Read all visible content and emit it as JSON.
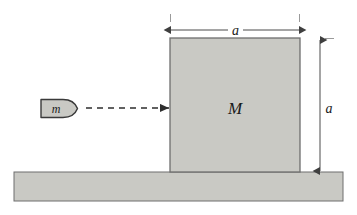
{
  "figure": {
    "background_color": "#ffffff"
  },
  "colors": {
    "block_fill": "#c9c9c4",
    "block_stroke": "#6e6e6e",
    "ground_fill": "#c9c9c4",
    "ground_stroke": "#6e6e6e",
    "bullet_fill": "#c9c9c4",
    "bullet_stroke": "#3a3a3a",
    "dimension_line": "#4a4a4a",
    "velocity_arrow": "#3a3a3a",
    "tick_mark": "#9a9a9a",
    "text": "#1a1a1a"
  },
  "objects": {
    "block": {
      "label": "M",
      "x": 170,
      "y": 38,
      "width": 130,
      "height": 134
    },
    "bullet": {
      "label": "m",
      "x": 40,
      "y": 99,
      "width": 38,
      "height": 19
    },
    "ground": {
      "x": 14,
      "y": 172,
      "width": 329,
      "height": 29
    }
  },
  "velocity_arrow": {
    "name": "dashed-velocity-arrow",
    "style": "dashed",
    "from_x": 86,
    "to_x": 170,
    "y": 108
  },
  "dimensions": {
    "horizontal": {
      "label": "a",
      "y": 30,
      "from_x": 170,
      "to_x": 300,
      "label_x": 235,
      "orientation": "horizontal"
    },
    "vertical": {
      "label": "a",
      "x": 320,
      "from_y": 38,
      "to_y": 172,
      "label_y": 108,
      "orientation": "vertical"
    }
  },
  "extension_ticks": [
    {
      "name": "tick-top-left",
      "x": 170,
      "y": 14
    },
    {
      "name": "tick-top-right",
      "x": 300,
      "y": 14
    },
    {
      "name": "tick-right-top",
      "x": 332,
      "y": 38
    }
  ]
}
